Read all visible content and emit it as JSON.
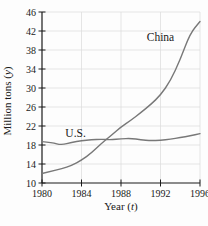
{
  "chart_data": {
    "type": "line",
    "title": "",
    "xlabel": {
      "prefix": "Year (",
      "var": "t",
      "suffix": ")"
    },
    "ylabel": {
      "prefix": "Million tons (",
      "var": "y",
      "suffix": ")"
    },
    "xlim": [
      1980,
      1996
    ],
    "ylim": [
      10,
      46
    ],
    "xticks": [
      1980,
      1984,
      1988,
      1992,
      1996
    ],
    "yticks": [
      10,
      14,
      18,
      22,
      26,
      30,
      34,
      38,
      42,
      46
    ],
    "grid": true,
    "legend_position": "inline-labels",
    "x": [
      1980,
      1981,
      1982,
      1983,
      1984,
      1985,
      1986,
      1987,
      1988,
      1989,
      1990,
      1991,
      1992,
      1993,
      1994,
      1995,
      1996
    ],
    "series": [
      {
        "name": "China",
        "color": "#787878",
        "values": [
          12,
          12.5,
          13,
          13.7,
          14.8,
          16.3,
          18.3,
          20,
          21.8,
          23.2,
          24.8,
          26.5,
          28.5,
          31.5,
          36,
          41.5,
          44
        ],
        "label_at": {
          "x": 1992.0,
          "y": 40.7
        }
      },
      {
        "name": "U.S.",
        "color": "#787878",
        "values": [
          18.7,
          18.5,
          18,
          18.6,
          18.9,
          19.1,
          19.2,
          19.1,
          19.3,
          19.4,
          19.1,
          18.9,
          19,
          19.2,
          19.6,
          19.9,
          20.4
        ],
        "label_at": {
          "x": 1983.4,
          "y": 20.6
        }
      }
    ],
    "colors": {
      "axis": "#1a1a1a",
      "grid": "#dedede",
      "text": "#1a1a1a"
    }
  }
}
